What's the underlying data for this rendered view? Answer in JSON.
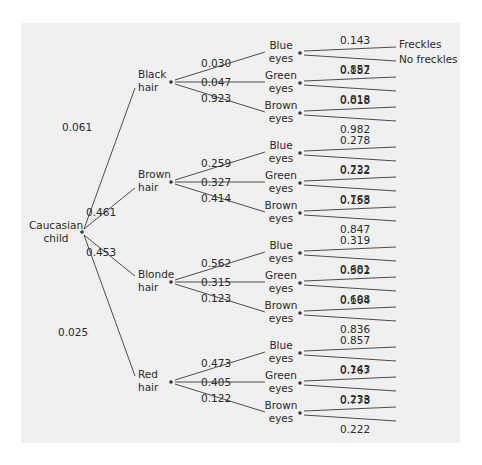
{
  "diagram": {
    "type": "probability-tree",
    "root": {
      "label_line1": "Caucasian",
      "label_line2": "child"
    },
    "leaf_labels": {
      "yes": "Freckles",
      "no": "No freckles"
    },
    "hair": [
      {
        "label_line1": "Black",
        "label_line2": "hair",
        "prob": "0.061",
        "eyes": [
          {
            "label_line1": "Blue",
            "label_line2": "eyes",
            "prob": "0.030",
            "freckles": "0.143",
            "no_freckles": "0.857"
          },
          {
            "label_line1": "Green",
            "label_line2": "eyes",
            "prob": "0.047",
            "freckles": "0.182",
            "no_freckles": "0.818"
          },
          {
            "label_line1": "Brown",
            "label_line2": "eyes",
            "prob": "0.923",
            "freckles": "0.018",
            "no_freckles": "0.982"
          }
        ]
      },
      {
        "label_line1": "Brown",
        "label_line2": "hair",
        "prob": "0.461",
        "eyes": [
          {
            "label_line1": "Blue",
            "label_line2": "eyes",
            "prob": "0.259",
            "freckles": "0.278",
            "no_freckles": "0.722"
          },
          {
            "label_line1": "Green",
            "label_line2": "eyes",
            "prob": "0.327",
            "freckles": "0.232",
            "no_freckles": "0.768"
          },
          {
            "label_line1": "Brown",
            "label_line2": "eyes",
            "prob": "0.414",
            "freckles": "0.153",
            "no_freckles": "0.847"
          }
        ]
      },
      {
        "label_line1": "Blonde",
        "label_line2": "hair",
        "prob": "0.453",
        "eyes": [
          {
            "label_line1": "Blue",
            "label_line2": "eyes",
            "prob": "0.562",
            "freckles": "0.319",
            "no_freckles": "0.681"
          },
          {
            "label_line1": "Green",
            "label_line2": "eyes",
            "prob": "0.315",
            "freckles": "0.302",
            "no_freckles": "0.698"
          },
          {
            "label_line1": "Brown",
            "label_line2": "eyes",
            "prob": "0.123",
            "freckles": "0.164",
            "no_freckles": "0.836"
          }
        ]
      },
      {
        "label_line1": "Red",
        "label_line2": "hair",
        "prob": "0.025",
        "eyes": [
          {
            "label_line1": "Blue",
            "label_line2": "eyes",
            "prob": "0.473",
            "freckles": "0.857",
            "no_freckles": "0.143"
          },
          {
            "label_line1": "Green",
            "label_line2": "eyes",
            "prob": "0.405",
            "freckles": "0.767",
            "no_freckles": "0.233"
          },
          {
            "label_line1": "Brown",
            "label_line2": "eyes",
            "prob": "0.122",
            "freckles": "0.778",
            "no_freckles": "0.222"
          }
        ]
      }
    ]
  }
}
